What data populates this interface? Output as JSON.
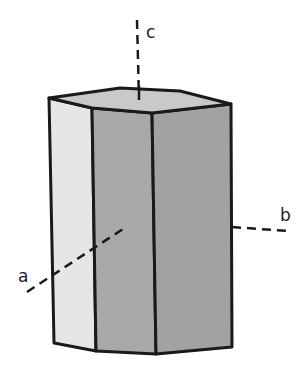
{
  "figure": {
    "axes": [
      {
        "name": "a",
        "label": "a"
      },
      {
        "name": "b",
        "label": "b"
      },
      {
        "name": "c",
        "label": "c"
      }
    ],
    "colors": {
      "top_face": "#c9c9c9",
      "left_face": "#e6e6e6",
      "front_face": "#a9a9a9",
      "right_face": "#a2a2a2",
      "edge": "#1a1a1a",
      "axis": "#1a1a1a"
    }
  }
}
